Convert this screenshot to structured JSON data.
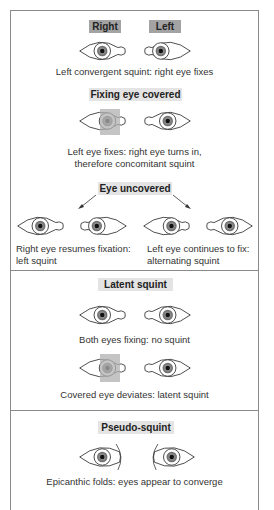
{
  "section1": {
    "label_right": "Right",
    "label_left": "Left",
    "caption1": "Left convergent squint: right eye fixes",
    "label_covered": "Fixing eye covered",
    "caption2_line1": "Left eye fixes: right eye turns in,",
    "caption2_line2": "therefore concomitant squint",
    "label_uncovered": "Eye uncovered",
    "caption3a_line1": "Right eye resumes fixation:",
    "caption3a_line2": "left squint",
    "caption3b_line1": "Left eye continues to fix:",
    "caption3b_line2": "alternating squint"
  },
  "section2": {
    "label": "Latent squint",
    "caption1": "Both eyes fixing: no squint",
    "caption2": "Covered eye deviates: latent squint"
  },
  "section3": {
    "label": "Pseudo-squint",
    "caption": "Epicanthic folds: eyes appear to converge"
  },
  "colors": {
    "border": "#8a8a8a",
    "label_dark": "#a3a3a3",
    "label_light": "#e4e4e4",
    "cover": "#b0b0b0",
    "iris": "#888888",
    "pupil": "#111111"
  }
}
